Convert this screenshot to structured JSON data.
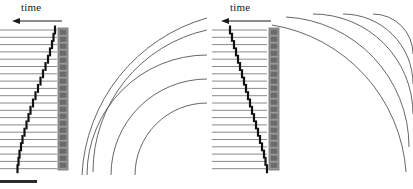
{
  "figure": {
    "title": "",
    "background_color": "#ffffff",
    "width": 413,
    "height": 189
  },
  "colors": {
    "trace_line": "#8a8a8a",
    "arrival_dash": "#111111",
    "array_strip": "#8e8e8e",
    "array_element": "#6b6b6b",
    "wavefront": "#555555",
    "scalebar": "#2b2b2b",
    "text": "#1a1a1a"
  },
  "panels": [
    {
      "id": "left",
      "axis_label": "time",
      "axis_arrow_direction": "left",
      "arrow_icon": "arrow-left-icon",
      "gather": {
        "trace_count": 20,
        "trace_left_x": 0,
        "trace_right_x": 57,
        "first_trace_y": 30,
        "trace_spacing": 7.3,
        "moveout_type": "hyperbolic",
        "arrival_x": [
          55,
          53.5,
          52,
          50,
          48,
          45.5,
          43,
          40.5,
          38,
          35.5,
          33,
          30.5,
          28.5,
          26.5,
          24.5,
          22.5,
          21,
          19.5,
          18.5,
          17.5
        ],
        "dash_height": 9,
        "dash_width": 2.2
      },
      "receiver_array": {
        "name": "receiver-array",
        "x": 58,
        "y": 28,
        "width": 10,
        "height": 142,
        "element_count": 20
      },
      "wavefronts": {
        "name": "wavefront-arcs",
        "count": 5,
        "center_x": 207,
        "center_y": 175,
        "radii": [
          72,
          96,
          120,
          145,
          172
        ],
        "description": "concentric arcs expanding from lower-right focus"
      }
    },
    {
      "id": "right",
      "axis_label": "time",
      "axis_arrow_direction": "left",
      "arrow_icon": "arrow-left-icon",
      "gather": {
        "trace_count": 20,
        "trace_left_x": 6,
        "trace_right_x": 61,
        "first_trace_y": 30,
        "trace_spacing": 7.3,
        "moveout_type": "linear",
        "arrival_x": [
          24,
          26,
          28,
          30,
          32,
          34,
          36,
          38,
          40,
          42,
          44,
          46,
          48,
          50,
          52,
          54,
          56,
          58,
          59.5,
          61
        ],
        "dash_height": 9,
        "dash_width": 2.2
      },
      "receiver_array": {
        "name": "receiver-array",
        "x": 63,
        "y": 28,
        "width": 10,
        "height": 142,
        "element_count": 20
      },
      "wavefronts": {
        "name": "wavefront-arcs",
        "count": 5,
        "center_x": 207,
        "center_y": 14,
        "radii": [
          40,
          70,
          100,
          130,
          160
        ],
        "description": "concentric arcs expanding from upper-right focus"
      }
    }
  ],
  "scalebar": {
    "name": "scale-bar",
    "label": "",
    "x": 0,
    "y": 180,
    "width": 37,
    "height": 3
  }
}
